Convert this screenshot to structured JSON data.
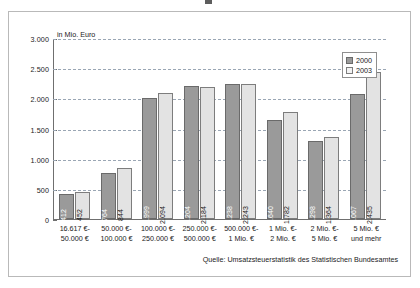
{
  "unit_label": "in Mio. Euro",
  "source_note": "Quelle: Umsatzsteuerstatistik des Statistischen Bundesamtes",
  "legend": {
    "items": [
      {
        "label": "2000",
        "color": "#9a9a9a"
      },
      {
        "label": "2003",
        "color": "#e3e3e3"
      }
    ]
  },
  "yaxis": {
    "ticks": [
      "0",
      "500",
      "1.000",
      "1.500",
      "2.000",
      "2.500",
      "3.000"
    ]
  },
  "categories_lines": [
    [
      "16.617 €-",
      "50.000 €"
    ],
    [
      "50.000 €-",
      "100.000 €"
    ],
    [
      "100.000 €-",
      "250.000 €"
    ],
    [
      "250.000 €-",
      "500.000 €"
    ],
    [
      "500.000 €-",
      "1 Mio. €"
    ],
    [
      "1 Mio. €-",
      "2 Mio. €"
    ],
    [
      "2 Mio. €-",
      "5 Mio. €"
    ],
    [
      "5 Mio. €",
      "und mehr"
    ]
  ],
  "bar_labels": {
    "g0": {
      "a": "412",
      "b": "452"
    },
    "g1": {
      "a": "764",
      "b": "844"
    },
    "g2": {
      "a": "1.999",
      "b": "2.094"
    },
    "g3": {
      "a": "2.204",
      "b": "2.184"
    },
    "g4": {
      "a": "2.238",
      "b": "2.243"
    },
    "g5": {
      "a": "1.640",
      "b": "1.782"
    },
    "g6": {
      "a": "1.298",
      "b": "1.364"
    },
    "g7": {
      "a": "2.067",
      "b": "2.435"
    }
  },
  "chart_data": {
    "type": "bar",
    "title": "",
    "xlabel": "",
    "ylabel": "in Mio. Euro",
    "ylim": [
      0,
      3000
    ],
    "ytick_values": [
      0,
      500,
      1000,
      1500,
      2000,
      2500,
      3000
    ],
    "grid": true,
    "legend_position": "top-right",
    "categories": [
      "16.617 €- 50.000 €",
      "50.000 €- 100.000 €",
      "100.000 €- 250.000 €",
      "250.000 €- 500.000 €",
      "500.000 €- 1 Mio. €",
      "1 Mio. €- 2 Mio. €",
      "2 Mio. €- 5 Mio. €",
      "5 Mio. € und mehr"
    ],
    "series": [
      {
        "name": "2000",
        "color": "#9a9a9a",
        "values": [
          412,
          764,
          1999,
          2204,
          2238,
          1640,
          1298,
          2067
        ]
      },
      {
        "name": "2003",
        "color": "#e3e3e3",
        "values": [
          452,
          844,
          2094,
          2184,
          2243,
          1782,
          1364,
          2435
        ]
      }
    ]
  }
}
